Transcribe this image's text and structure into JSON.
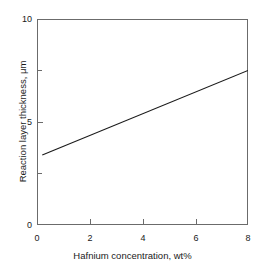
{
  "chart_data": {
    "type": "line",
    "title": "",
    "xlabel": "Hafnium concentration, wt%",
    "ylabel": "Reaction layer thickness, μm",
    "xlim": [
      0,
      8
    ],
    "ylim": [
      0,
      10
    ],
    "xticks": [
      0,
      2,
      4,
      6,
      8
    ],
    "xtick_labels": [
      "0",
      "2",
      "4",
      "6",
      "8"
    ],
    "yticks": [
      0,
      5,
      10
    ],
    "ytick_labels": [
      "0",
      "5",
      "10"
    ],
    "y_minor_ticks": [
      2.5,
      7.5
    ],
    "grid": false,
    "legend": null,
    "series": [
      {
        "name": "Reaction layer thickness",
        "color": "#1a1a1a",
        "x": [
          0.2,
          8.0
        ],
        "values": [
          3.4,
          7.5
        ]
      }
    ],
    "annotations": []
  },
  "figure": {
    "background_color": "#ffffff",
    "axis_color": "#6b6b6b",
    "text_color": "#1a1a1a"
  }
}
